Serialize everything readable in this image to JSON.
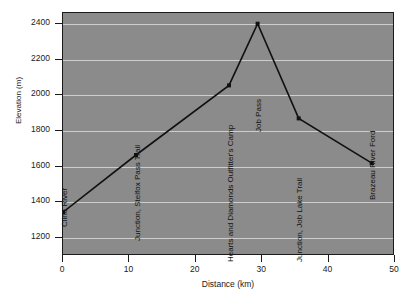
{
  "chart_data": {
    "type": "line",
    "title": "",
    "xlabel": "Distance (km)",
    "ylabel": "Elevation (m)",
    "xlim": [
      0,
      50
    ],
    "ylim": [
      1100,
      2460
    ],
    "xticks": [
      0,
      10,
      20,
      30,
      40,
      50
    ],
    "yticks": [
      1200,
      1400,
      1600,
      1800,
      2000,
      2200,
      2400
    ],
    "grid": true,
    "legend": "none",
    "plot_background": "#8b8b8b",
    "gridline_color": "#d8d8d8",
    "line_color": "#111111",
    "marker_color": "#111111",
    "x": [
      0,
      11,
      25,
      29.3,
      35.5,
      46.5
    ],
    "y": [
      1345,
      1665,
      2055,
      2400,
      1870,
      1620
    ],
    "point_labels": [
      "Cline River",
      "Junction, Stelfox Pass Trail",
      "Hearts and Diamonds Outfitter's Camp",
      "Job Pass",
      "Junction, Job Lake Trail",
      "Brazeau River Ford"
    ]
  }
}
